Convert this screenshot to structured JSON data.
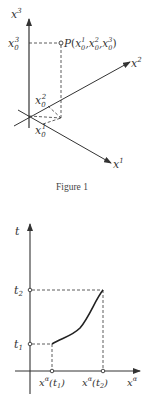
{
  "figure1": {
    "caption": "Figure 1",
    "axes": {
      "x1": {
        "base": "x",
        "sup": "1"
      },
      "x2": {
        "base": "x",
        "sup": "2"
      },
      "x3": {
        "base": "x",
        "sup": "3"
      }
    },
    "point_label": {
      "name": "P",
      "open": "(",
      "comps": [
        "x",
        "x",
        "x"
      ],
      "subs": [
        "0",
        "0",
        "0"
      ],
      "sups": [
        "1",
        "2",
        "3"
      ],
      "close": ")"
    },
    "projections": {
      "x0_1": {
        "base": "x",
        "sub": "0",
        "sup": "1"
      },
      "x0_2": {
        "base": "x",
        "sub": "0",
        "sup": "2"
      },
      "x0_3": {
        "base": "x",
        "sub": "0",
        "sup": "3"
      }
    }
  },
  "figure2": {
    "y_axis": {
      "label": "t"
    },
    "x_axis": {
      "base": "x",
      "sup": "α"
    },
    "ticks_y": [
      {
        "base": "t",
        "sub": "2"
      },
      {
        "base": "t",
        "sub": "1"
      }
    ],
    "ticks_x": [
      {
        "base": "x",
        "sup": "α",
        "arg": "(t",
        "argsub": "1",
        "close": ")"
      },
      {
        "base": "x",
        "sup": "α",
        "arg": "(t",
        "argsub": "2",
        "close": ")"
      }
    ]
  },
  "colors": {
    "line": "#333333",
    "background": "#ffffff"
  }
}
